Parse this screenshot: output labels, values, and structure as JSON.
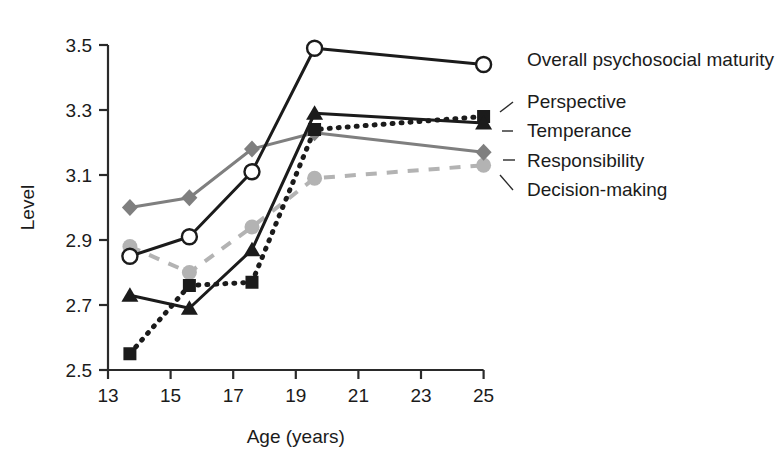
{
  "chart_data": {
    "type": "line",
    "title": "",
    "xlabel": "Age (years)",
    "ylabel": "Level",
    "xlim": [
      13,
      25
    ],
    "ylim": [
      2.5,
      3.5
    ],
    "grid": false,
    "legend_position": "right-inline-labels",
    "xticks": [
      13,
      15,
      17,
      19,
      21,
      23,
      25
    ],
    "xtick_labels": [
      "13",
      "15",
      "17",
      "19",
      "21",
      "23",
      "25"
    ],
    "yticks": [
      2.5,
      2.7,
      2.9,
      3.1,
      3.3,
      3.5
    ],
    "ytick_labels": [
      "2.5",
      "2.7",
      "2.9",
      "3.1",
      "3.3",
      "3.5"
    ],
    "x": [
      13.7,
      15.6,
      17.6,
      19.6,
      25.0
    ],
    "series": [
      {
        "name": "Overall psychosocial maturity",
        "marker": "open-circle",
        "line_style": "solid",
        "color": "#1b1b1b",
        "x": [
          13.7,
          15.6,
          17.6,
          19.6,
          25.0
        ],
        "values": [
          2.85,
          2.91,
          3.11,
          3.49,
          3.44
        ]
      },
      {
        "name": "Perspective",
        "marker": "filled-square",
        "line_style": "dotted",
        "color": "#1b1b1b",
        "x": [
          13.7,
          15.6,
          17.6,
          19.6,
          25.0
        ],
        "values": [
          2.55,
          2.76,
          2.77,
          3.24,
          3.28
        ]
      },
      {
        "name": "Temperance",
        "marker": "filled-triangle",
        "line_style": "solid",
        "color": "#1b1b1b",
        "x": [
          13.7,
          15.6,
          17.6,
          19.6,
          25.0
        ],
        "values": [
          2.73,
          2.69,
          2.87,
          3.29,
          3.26
        ]
      },
      {
        "name": "Responsibility",
        "marker": "filled-diamond",
        "line_style": "solid",
        "color": "#7f7f7f",
        "x": [
          13.7,
          15.6,
          17.6,
          19.6,
          25.0
        ],
        "values": [
          3.0,
          3.03,
          3.18,
          3.23,
          3.17
        ]
      },
      {
        "name": "Decision-making",
        "marker": "filled-circle",
        "line_style": "dashed",
        "color": "#b3b3b3",
        "x": [
          13.7,
          15.6,
          17.6,
          19.6,
          25.0
        ],
        "values": [
          2.88,
          2.8,
          2.94,
          3.09,
          3.13
        ]
      }
    ],
    "labels": [
      {
        "text": "Overall psychosocial maturity",
        "anchor_series": "Overall psychosocial maturity"
      },
      {
        "text": "Perspective",
        "anchor_series": "Perspective"
      },
      {
        "text": "Temperance",
        "anchor_series": "Temperance"
      },
      {
        "text": "Responsibility",
        "anchor_series": "Responsibility"
      },
      {
        "text": "Decision-making",
        "anchor_series": "Decision-making"
      }
    ]
  }
}
